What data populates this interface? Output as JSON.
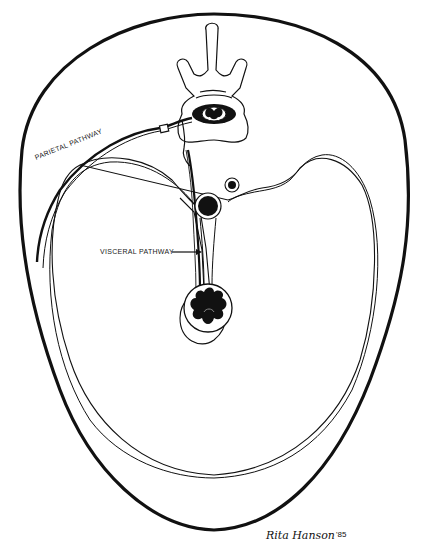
{
  "diagram": {
    "labels": {
      "parietal": "PARIETAL PATHWAY",
      "visceral": "VISCERAL PATHWAY"
    },
    "signature": {
      "name": "Rita Hanson",
      "year": "'85"
    },
    "structures": [
      "body-wall-outline",
      "peritoneal-cavity-outline",
      "vertebra",
      "spinal-cord",
      "aorta",
      "inferior-vena-cava",
      "mesentery",
      "bowel-loop",
      "parietal-nerve",
      "visceral-nerve"
    ],
    "colors": {
      "ink": "#111111",
      "background": "#ffffff"
    }
  }
}
